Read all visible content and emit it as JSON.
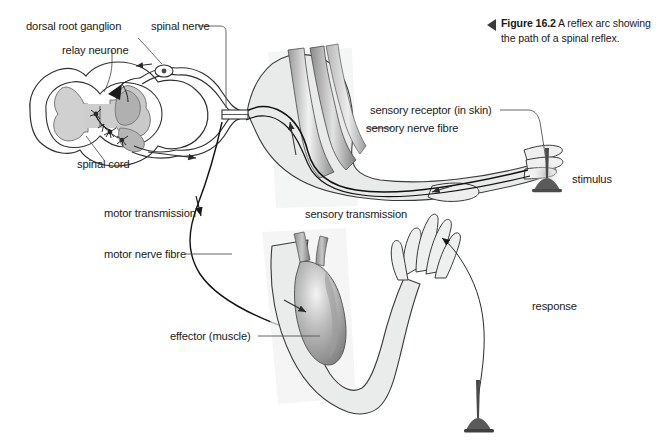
{
  "figure": {
    "marker_icon": "left-triangle-icon",
    "number_label": "Figure 16.2",
    "caption_text": " A reflex arc showing the path of a spinal reflex."
  },
  "labels": {
    "dorsal_root_ganglion": "dorsal root ganglion",
    "spinal_nerve": "spinal nerve",
    "relay_neurone": "relay neurone",
    "spinal_cord": "spinal cord",
    "sensory_receptor": "sensory receptor (in skin)",
    "sensory_nerve_fibre": "sensory nerve fibre",
    "stimulus": "stimulus",
    "sensory_transmission": "sensory transmission",
    "motor_transmission": "motor transmission",
    "motor_nerve_fibre": "motor nerve fibre",
    "effector_muscle": "effector (muscle)",
    "response": "response"
  },
  "colors": {
    "background": "#ffffff",
    "ink": "#1a1a1a",
    "outline": "#333333",
    "limb_fill": "#e9eaea",
    "grey_matter": "#c9c9c9",
    "muscle_dark": "#8d8d8d",
    "muscle_mid": "#a8a8a8",
    "muscle_light": "#d8d8d8",
    "caption_marker": "#3b3b3b",
    "leader_line": "#555555"
  },
  "structures": [
    {
      "name": "spinal-cord-cross-section",
      "description": "butterfly grey matter within oval cord outline"
    },
    {
      "name": "dorsal-root-ganglion",
      "description": "small oval swelling on dorsal root"
    },
    {
      "name": "relay-neurone",
      "description": "star-shaped interneurone cell bodies in grey matter"
    },
    {
      "name": "spinal-nerve",
      "description": "paired nerve trunk leaving cord to the right"
    },
    {
      "name": "upper-arm-limb",
      "description": "flexed arm with gradient muscle bands and hand"
    },
    {
      "name": "lower-arm-limb",
      "description": "withdrawn arm with effector muscle and open hand"
    },
    {
      "name": "stimulus-pin-upper",
      "description": "tack pressed into finger skin"
    },
    {
      "name": "stimulus-pin-lower",
      "description": "tack below the withdrawn hand"
    }
  ],
  "arrows": [
    {
      "name": "sensory-transmission-arrow",
      "direction": "toward-spinal-cord"
    },
    {
      "name": "motor-transmission-arrow",
      "direction": "away-from-spinal-cord"
    },
    {
      "name": "response-arrow",
      "direction": "curved-to-hand"
    },
    {
      "name": "cord-flow-arrow",
      "direction": "right"
    },
    {
      "name": "dorsal-root-arrow",
      "direction": "left"
    },
    {
      "name": "upper-arm-arrow",
      "direction": "up"
    },
    {
      "name": "effector-arrow",
      "direction": "down-right"
    }
  ]
}
